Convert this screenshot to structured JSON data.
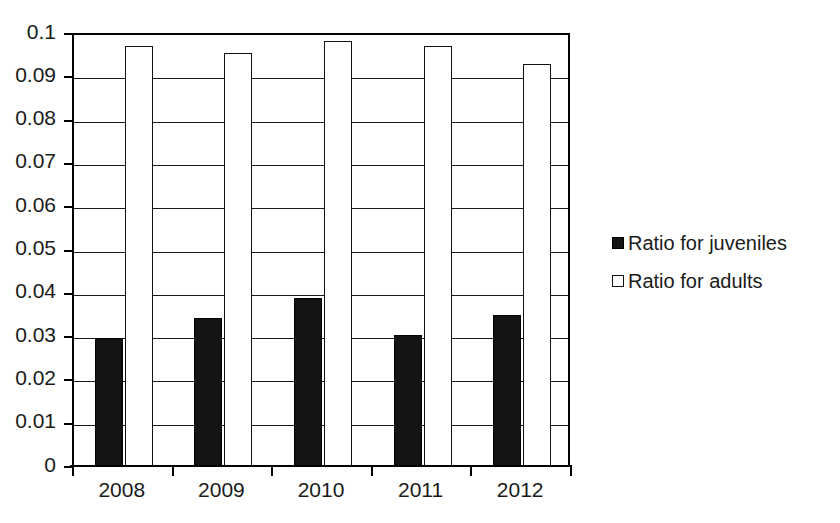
{
  "chart_data": {
    "type": "bar",
    "title": "",
    "subtitle": "",
    "xlabel": "",
    "ylabel": "",
    "categories": [
      "2008",
      "2009",
      "2010",
      "2011",
      "2012"
    ],
    "series": [
      {
        "name": "Ratio for juveniles",
        "marker": "filled-square",
        "color": "#141414",
        "values": [
          0.0295,
          0.0342,
          0.0388,
          0.0303,
          0.0348
        ]
      },
      {
        "name": "Ratio for adults",
        "marker": "hollow-square",
        "color": "#ffffff",
        "values": [
          0.097,
          0.0953,
          0.0982,
          0.0969,
          0.0928
        ]
      }
    ],
    "ylim": [
      0,
      0.1
    ],
    "ytick_step": 0.01,
    "ytick_labels": [
      "0.1",
      "0.09",
      "0.08",
      "0.07",
      "0.06",
      "0.05",
      "0.04",
      "0.03",
      "0.02",
      "0.01",
      "0"
    ],
    "ytick_values": [
      0.1,
      0.09,
      0.08,
      0.07,
      0.06,
      0.05,
      0.04,
      0.03,
      0.02,
      0.01,
      0
    ],
    "grid": true,
    "grid_axis": "y",
    "legend_position": "right",
    "plot_border": "left-top-right",
    "background": "#ffffff",
    "axis_color": "#000000"
  }
}
